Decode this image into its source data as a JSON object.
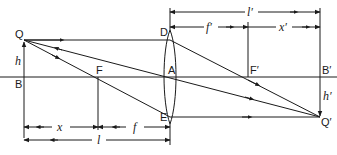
{
  "diagram": {
    "type": "thin-lens-ray-diagram",
    "points": {
      "object_tip": "Q",
      "object_base": "B",
      "object_focus": "F",
      "lens_center": "A",
      "lens_top": "D",
      "lens_bottom": "E",
      "image_focus": "F′",
      "image_base": "B′",
      "image_tip": "Q′"
    },
    "heights": {
      "object": "h",
      "image": "h′"
    },
    "dimensions": {
      "object_distance": "l",
      "object_to_focus": "x",
      "focal_length": "f",
      "image_distance": "l′",
      "image_focal_length": "f′",
      "focus_to_image": "x′"
    },
    "rays": [
      {
        "name": "parallel-ray",
        "from": "Q",
        "via": "D",
        "to": "Q′"
      },
      {
        "name": "chief-ray",
        "from": "Q",
        "via": "A",
        "to": "Q′"
      },
      {
        "name": "focal-ray",
        "from": "Q",
        "via": "F",
        "to": "E",
        "then": "Q′"
      }
    ]
  }
}
